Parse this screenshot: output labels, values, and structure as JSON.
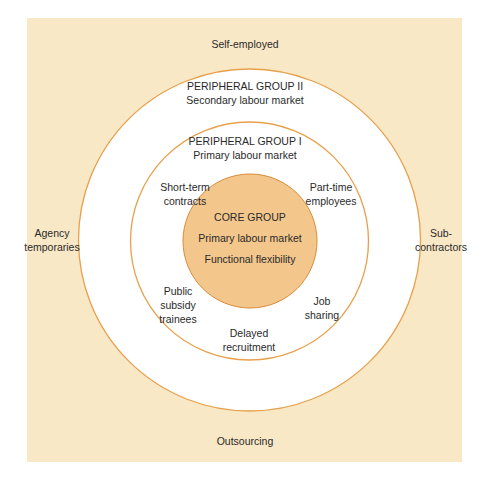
{
  "colors": {
    "background_band": "#f9e8c6",
    "ring_fill": "#ffffff",
    "ring_stroke": "#e8a04c",
    "core_fill": "#f3c68c",
    "core_stroke": "#d98c3a",
    "text": "#2a2a2a"
  },
  "outer_labels": {
    "top": "Self-employed",
    "left": "Agency\ntemporaries",
    "right": "Sub-\ncontractors",
    "bottom": "Outsourcing"
  },
  "peripheral_group_2": {
    "title": "PERIPHERAL GROUP II",
    "subtitle": "Secondary labour market"
  },
  "peripheral_group_1": {
    "title": "PERIPHERAL GROUP I",
    "subtitle": "Primary labour market",
    "items": {
      "upper_left": "Short-term\ncontracts",
      "upper_right": "Part-time\nemployees",
      "lower_left": "Public\nsubsidy\ntrainees",
      "lower_right": "Job\nsharing",
      "bottom": "Delayed\nrecruitment"
    }
  },
  "core_group": {
    "title": "CORE GROUP",
    "line1": "Primary labour market",
    "line2": "Functional flexibility"
  }
}
